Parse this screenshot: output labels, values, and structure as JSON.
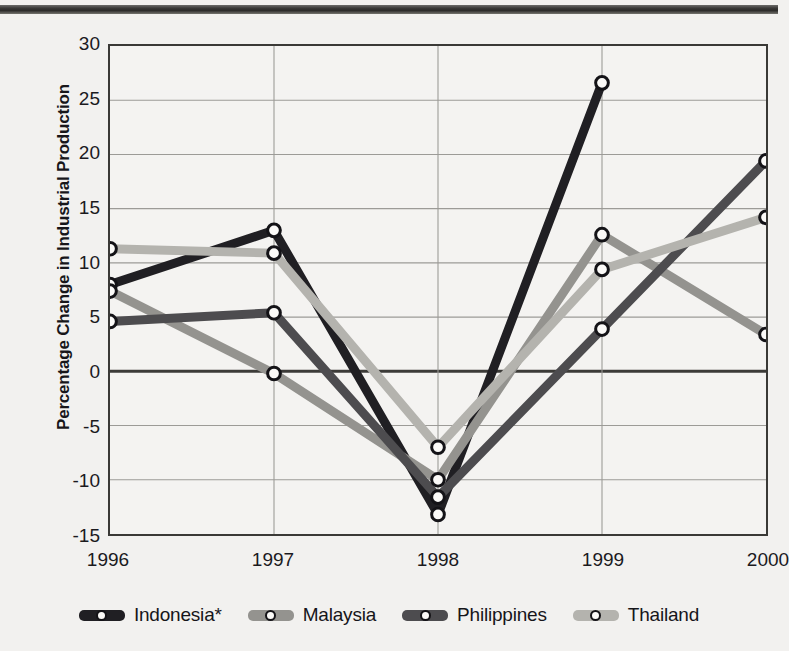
{
  "chart_data": {
    "type": "line",
    "title": "",
    "xlabel": "",
    "ylabel": "Percentage Change in Industrial Production",
    "x": [
      1996,
      1997,
      1998,
      1999,
      2000
    ],
    "xtick_labels": [
      "1996",
      "1997",
      "1998",
      "1999",
      "2000"
    ],
    "ytick_labels": [
      "30",
      "25",
      "20",
      "15",
      "10",
      "5",
      "0",
      "-5",
      "-10",
      "-15"
    ],
    "ytick_values": [
      30,
      25,
      20,
      15,
      10,
      5,
      0,
      -5,
      -10,
      -15
    ],
    "ylim": [
      -15,
      30
    ],
    "xlim": [
      1996,
      2000
    ],
    "grid": true,
    "zero_line": true,
    "legend_position": "bottom",
    "series": [
      {
        "name": "Indonesia*",
        "color": "#201f23",
        "values": [
          8.0,
          13.0,
          -13.2,
          26.6,
          null
        ]
      },
      {
        "name": "Malaysia",
        "color": "#94938f",
        "values": [
          7.4,
          -0.2,
          -10.0,
          12.6,
          3.4
        ]
      },
      {
        "name": "Philippines",
        "color": "#4d4c4f",
        "values": [
          4.6,
          5.4,
          -11.6,
          3.9,
          19.4
        ]
      },
      {
        "name": "Thailand",
        "color": "#b4b3ae",
        "values": [
          11.3,
          10.9,
          -7.0,
          9.4,
          14.2
        ]
      }
    ]
  },
  "legend": {
    "items": [
      {
        "label": "Indonesia*",
        "color": "#201f23"
      },
      {
        "label": "Malaysia",
        "color": "#94938f"
      },
      {
        "label": "Philippines",
        "color": "#4d4c4f"
      },
      {
        "label": "Thailand",
        "color": "#b4b3ae"
      }
    ]
  },
  "axis": {
    "y_title": "Percentage Change in Industrial Production"
  },
  "colors": {
    "background": "#f2f1ef",
    "plot_background": "#f4f3f1",
    "frame": "#3a3936",
    "gridline": "#9c9b97",
    "zero_line": "#3c3b38",
    "marker_fill": "#fbfaf8",
    "marker_stroke": "#141317",
    "top_rule": "#33322f"
  }
}
